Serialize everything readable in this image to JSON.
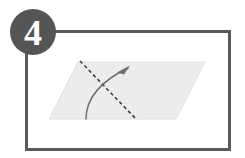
{
  "diagram": {
    "step_badge": {
      "label": "4",
      "shape": "circle",
      "fill_color": "#555555",
      "text_color": "#ffffff",
      "center_x": 33,
      "center_y": 32,
      "radius": 23
    },
    "frame": {
      "name": "panel-border",
      "stroke_color": "#5a5a5a",
      "fill_color": "#ffffff",
      "stroke_width": 3,
      "x": 25,
      "y": 30,
      "width": 206,
      "height": 121
    },
    "sheet": {
      "name": "paper-parallelogram",
      "fill_color": "#ececed",
      "stroke_color": "#e2e2e3",
      "points": "78,62 205,62 176,119 49,119"
    },
    "fold_line": {
      "name": "fold-crease-dashed-line",
      "stroke_color": "#3f3f3f",
      "stroke_width": 1.6,
      "dash_pattern": "3.5,2.8",
      "x1": 80,
      "y1": 61,
      "x2": 137,
      "y2": 120
    },
    "fold_arrow": {
      "name": "fold-direction-arrow",
      "stroke_color": "#6e6e70",
      "stroke_width": 1.5,
      "path": "M 86,119 C 86,103 95,84 128,68",
      "arrowhead_points": "130,65.5 117,72.5 124,74.5",
      "tip_x": 130,
      "tip_y": 65
    },
    "background_color": "#ffffff"
  },
  "labels": {
    "step_caption": "4"
  }
}
